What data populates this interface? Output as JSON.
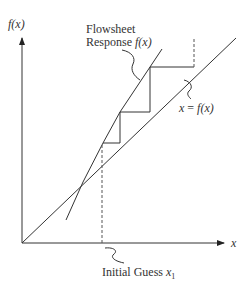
{
  "diagram": {
    "axes": {
      "y_label": "f(x)",
      "x_label": "x"
    },
    "labels": {
      "flowsheet_line1": "Flowsheet",
      "flowsheet_line2": "Response ",
      "flowsheet_fx": "f(x)",
      "identity_x": "x",
      "identity_eq": " = ",
      "identity_fx": "f(x)",
      "initial_guess": "Initial Guess ",
      "initial_guess_var": "x",
      "initial_guess_sub": "1"
    },
    "colors": {
      "line": "#333333",
      "background": "#ffffff"
    }
  }
}
